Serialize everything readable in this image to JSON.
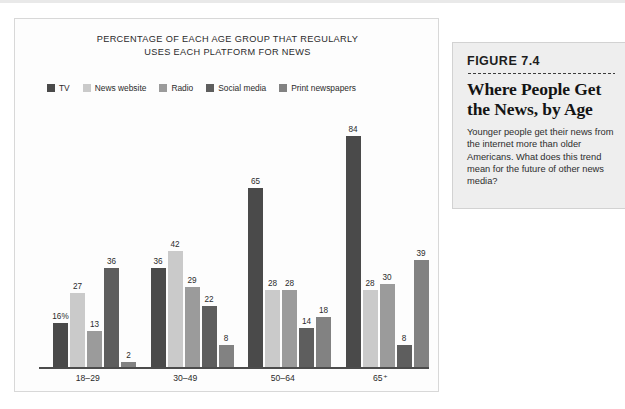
{
  "chart_data": {
    "type": "bar",
    "title": "PERCENTAGE OF EACH AGE GROUP THAT REGULARLY USES EACH PLATFORM FOR NEWS",
    "title_line1": "PERCENTAGE OF EACH AGE GROUP THAT REGULARLY",
    "title_line2": "USES EACH PLATFORM FOR NEWS",
    "xlabel": "",
    "ylabel": "",
    "ylim": [
      0,
      90
    ],
    "grid": false,
    "legend_position": "top",
    "categories": [
      "18–29",
      "30–49",
      "50–64",
      "65⁺"
    ],
    "series": [
      {
        "name": "TV",
        "color": "#4a4a4a",
        "values": [
          16,
          36,
          65,
          84
        ],
        "labels": [
          "16%",
          "36",
          "65",
          "84"
        ]
      },
      {
        "name": "News website",
        "color": "#cacaca",
        "values": [
          27,
          42,
          28,
          28
        ],
        "labels": [
          "27",
          "42",
          "28",
          "28"
        ]
      },
      {
        "name": "Radio",
        "color": "#9b9b9b",
        "values": [
          13,
          29,
          28,
          30
        ],
        "labels": [
          "13",
          "29",
          "28",
          "30"
        ]
      },
      {
        "name": "Social media",
        "color": "#5e5e5e",
        "values": [
          36,
          22,
          14,
          8
        ],
        "labels": [
          "36",
          "22",
          "14",
          "8"
        ]
      },
      {
        "name": "Print newspapers",
        "color": "#828282",
        "values": [
          2,
          8,
          18,
          39
        ],
        "labels": [
          "2",
          "8",
          "18",
          "39"
        ]
      }
    ]
  },
  "figure": {
    "number": "FIGURE 7.4",
    "heading": "Where People Get the News, by Age",
    "body": "Younger people get their news from the internet more than older Americans. What does this trend mean for the future of other news media?"
  }
}
